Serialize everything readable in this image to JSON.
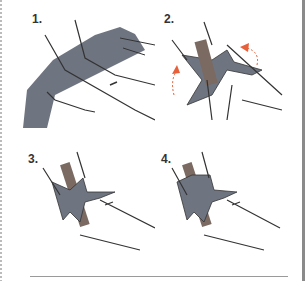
{
  "steps": [
    {
      "number": "1.",
      "description": "Hands gripping grey cloth wrapped around forearm"
    },
    {
      "number": "2.",
      "description": "Stick placed on cloth; cloth ends twisted around stick, orange arrows indicating direction"
    },
    {
      "number": "3.",
      "description": "Cloth tied in a knot around the stick"
    },
    {
      "number": "4.",
      "description": "Cloth ends tied over stick, securing it"
    }
  ],
  "colors": {
    "cloth": "#6f7580",
    "stick": "#7a6a62",
    "arrow": "#e8603a",
    "outline": "#333333"
  }
}
